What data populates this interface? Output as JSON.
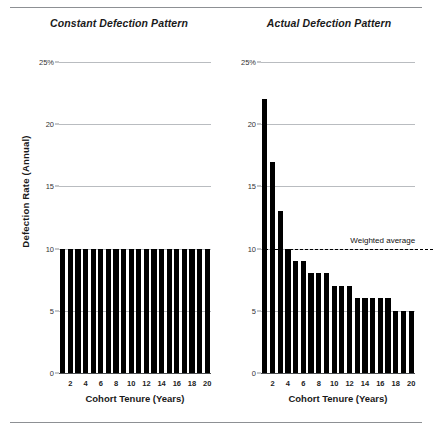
{
  "figure": {
    "y_axis_caption": "Defection Rate (Annual)"
  },
  "chart_data": [
    {
      "type": "bar",
      "title": "Constant Defection Pattern",
      "xlabel": "Cohort Tenure (Years)",
      "ylabel": "Defection Rate (Annual)",
      "ylim": [
        0,
        25
      ],
      "yticks": [
        0,
        5,
        10,
        15,
        20,
        25
      ],
      "ytick_labels": [
        "0",
        "5",
        "10",
        "15",
        "20",
        "25%"
      ],
      "grid": true,
      "x": [
        1,
        2,
        3,
        4,
        5,
        6,
        7,
        8,
        9,
        10,
        11,
        12,
        13,
        14,
        15,
        16,
        17,
        18,
        19,
        20
      ],
      "xtick_positions": [
        2,
        4,
        6,
        8,
        10,
        12,
        14,
        16,
        18,
        20
      ],
      "xtick_labels": [
        "2",
        "4",
        "6",
        "8",
        "10",
        "12",
        "14",
        "16",
        "18",
        "20"
      ],
      "values": [
        10,
        10,
        10,
        10,
        10,
        10,
        10,
        10,
        10,
        10,
        10,
        10,
        10,
        10,
        10,
        10,
        10,
        10,
        10,
        10
      ],
      "bar_color": "#000000"
    },
    {
      "type": "bar",
      "title": "Actual Defection Pattern",
      "xlabel": "Cohort Tenure (Years)",
      "ylabel": "Defection Rate (Annual)",
      "ylim": [
        0,
        25
      ],
      "yticks": [
        0,
        5,
        10,
        15,
        20,
        25
      ],
      "ytick_labels": [
        "0",
        "5",
        "10",
        "15",
        "20",
        "25%"
      ],
      "grid": true,
      "x": [
        1,
        2,
        3,
        4,
        5,
        6,
        7,
        8,
        9,
        10,
        11,
        12,
        13,
        14,
        15,
        16,
        17,
        18,
        19,
        20
      ],
      "xtick_positions": [
        2,
        4,
        6,
        8,
        10,
        12,
        14,
        16,
        18,
        20
      ],
      "xtick_labels": [
        "2",
        "4",
        "6",
        "8",
        "10",
        "12",
        "14",
        "16",
        "18",
        "20"
      ],
      "values": [
        22,
        17,
        13,
        10,
        9,
        9,
        8,
        8,
        8,
        7,
        7,
        7,
        6,
        6,
        6,
        6,
        6,
        5,
        5,
        5
      ],
      "bar_color": "#000000",
      "annotations": [
        {
          "type": "hline",
          "label": "Weighted average",
          "value": 10,
          "style": "dashed",
          "color": "#000000"
        }
      ]
    }
  ]
}
